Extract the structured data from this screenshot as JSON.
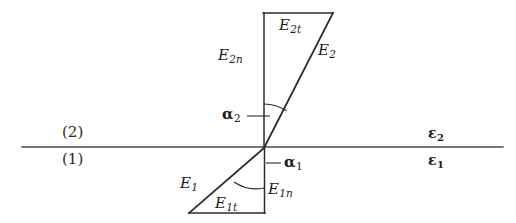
{
  "figure": {
    "background_color": "#ffffff",
    "line_color": "#2b2b2b",
    "boundary_color": "#4a4a4a"
  },
  "regions": {
    "upper_label": "(2)",
    "lower_label": "(1)"
  },
  "permittivities": {
    "upper": "ε",
    "upper_sub": "2",
    "lower": "ε",
    "lower_sub": "1"
  },
  "vectors": {
    "e2": {
      "base": "E",
      "sub": "2"
    },
    "e2n": {
      "base": "E",
      "sub": "2n"
    },
    "e2t": {
      "base": "E",
      "sub": "2t"
    },
    "e1": {
      "base": "E",
      "sub": "1"
    },
    "e1n": {
      "base": "E",
      "sub": "1n"
    },
    "e1t": {
      "base": "E",
      "sub": "1t"
    }
  },
  "angles": {
    "alpha2": {
      "base": "α",
      "sub": "2"
    },
    "alpha1": {
      "base": "α",
      "sub": "1"
    }
  },
  "geometry": {
    "origin": {
      "x": 264,
      "y": 148
    },
    "boundary": {
      "x1": 22,
      "y1": 147,
      "x2": 503,
      "y2": 147
    },
    "normal_axis": {
      "x": 264,
      "y_top": 13,
      "y_bottom": 213
    },
    "upper_construction": {
      "top_horizontal": {
        "x1": 263,
        "y1": 13,
        "x2": 332,
        "y2": 13
      },
      "diagonal": {
        "x1": 264,
        "y1": 148,
        "x2": 332,
        "y2": 13
      }
    },
    "lower_construction": {
      "bottom_horizontal": {
        "x1": 190,
        "y1": 213,
        "x2": 265,
        "y2": 213
      },
      "diagonal": {
        "x1": 264,
        "y1": 148,
        "x2": 190,
        "y2": 213
      }
    },
    "arc_alpha2": {
      "radius": 42,
      "from_deg": 90,
      "to_deg": 63
    },
    "arc_alpha1": {
      "radius": 40,
      "from_deg": 270,
      "to_deg": 221
    }
  }
}
